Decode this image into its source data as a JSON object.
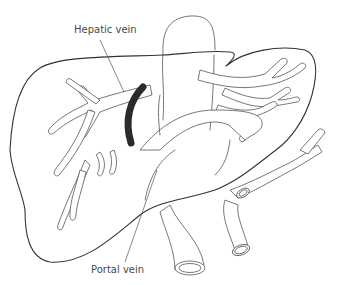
{
  "diagram": {
    "labels": {
      "hepatic_vein": "Hepatic vein",
      "portal_vein": "Portal vein"
    },
    "colors": {
      "line": "#555555",
      "outline": "#333333",
      "shunt": "#2b2b2b",
      "label_text": "#4a4a4a",
      "background": "#ffffff"
    }
  }
}
